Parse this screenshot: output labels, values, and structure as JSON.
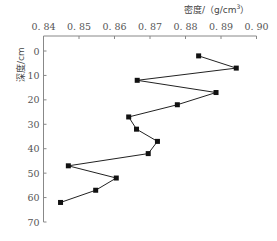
{
  "chart_data": {
    "type": "line",
    "title": "",
    "xlabel": "密度/（g/cm³）",
    "xlabel_parts": {
      "main": "密度/（g/cm",
      "sup": "3",
      "end": "）"
    },
    "ylabel": "深度/cm",
    "x_axis_position": "top",
    "y_inverted": true,
    "xlim": [
      0.84,
      0.9
    ],
    "ylim": [
      0,
      70
    ],
    "xticks": [
      0.84,
      0.85,
      0.86,
      0.87,
      0.88,
      0.89,
      0.9
    ],
    "xtick_labels": [
      "0. 84",
      "0. 85",
      "0. 86",
      "0. 87",
      "0. 88",
      "0. 89",
      "0. 90"
    ],
    "yticks": [
      0,
      10,
      20,
      30,
      40,
      50,
      60,
      70
    ],
    "ytick_labels": [
      "0",
      "10",
      "20",
      "30",
      "40",
      "50",
      "60",
      "70"
    ],
    "grid": false,
    "legend": null,
    "series": [
      {
        "name": "密度",
        "marker": "square",
        "color": "#111111",
        "points": [
          {
            "density": 0.8837,
            "depth": 2
          },
          {
            "density": 0.8943,
            "depth": 7
          },
          {
            "density": 0.8664,
            "depth": 12
          },
          {
            "density": 0.8886,
            "depth": 17
          },
          {
            "density": 0.8777,
            "depth": 22
          },
          {
            "density": 0.864,
            "depth": 27
          },
          {
            "density": 0.8662,
            "depth": 32
          },
          {
            "density": 0.8721,
            "depth": 37
          },
          {
            "density": 0.8695,
            "depth": 42
          },
          {
            "density": 0.847,
            "depth": 47
          },
          {
            "density": 0.8605,
            "depth": 52
          },
          {
            "density": 0.8547,
            "depth": 57
          },
          {
            "density": 0.8448,
            "depth": 62
          }
        ]
      }
    ]
  }
}
